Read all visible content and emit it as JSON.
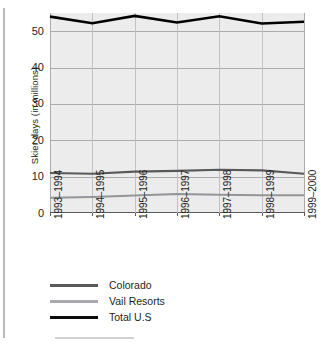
{
  "chart_data": {
    "type": "line",
    "title": "",
    "xlabel": "",
    "ylabel": "Skier days (in millions)",
    "categories": [
      "1993–1994",
      "1994–1995",
      "1995–1996",
      "1996–1997",
      "1997–1998",
      "1998–1999",
      "1999–2000"
    ],
    "ylim": [
      0,
      55
    ],
    "yticks": [
      0,
      10,
      20,
      30,
      40,
      50
    ],
    "ytick_labels": [
      "0",
      "10",
      "20",
      "30",
      "40",
      "50"
    ],
    "grid": true,
    "legend_position": "below-axis",
    "series": [
      {
        "name": "Total U.S",
        "color": "#000000",
        "width": 2.6,
        "values": [
          54.0,
          52.2,
          54.2,
          52.4,
          54.1,
          52.1,
          52.6
        ]
      },
      {
        "name": "Colorado",
        "color": "#58595b",
        "width": 2.2,
        "values": [
          11.0,
          10.8,
          11.4,
          11.6,
          11.9,
          11.7,
          10.8
        ]
      },
      {
        "name": "Vail Resorts",
        "color": "#939598",
        "width": 2.0,
        "values": [
          4.2,
          4.4,
          4.8,
          5.2,
          5.0,
          4.9,
          4.9
        ]
      }
    ]
  },
  "legend": {
    "items": [
      {
        "label": "Colorado",
        "color": "#58595b"
      },
      {
        "label": "Vail Resorts",
        "color": "#a7a9ac"
      },
      {
        "label": "Total U.S",
        "color": "#0d0d0d"
      }
    ]
  },
  "axis": {
    "y_title": "Skier days (in millions)"
  }
}
